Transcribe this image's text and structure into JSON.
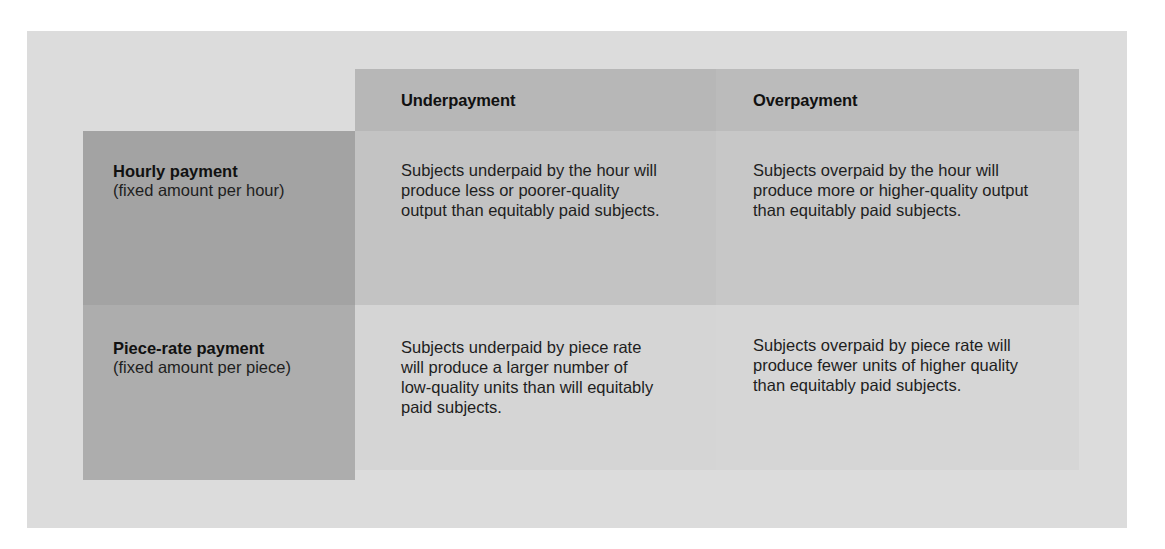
{
  "table": {
    "columns": [
      {
        "label": "Underpayment"
      },
      {
        "label": "Overpayment"
      }
    ],
    "rows": [
      {
        "title": "Hourly payment",
        "subtitle": "(fixed amount per hour)",
        "cells": [
          "Subjects underpaid by the hour will produce less or poorer-quality output than equitably paid subjects.",
          "Subjects overpaid by the hour will produce more or higher-quality output than equitably paid subjects."
        ]
      },
      {
        "title": "Piece-rate payment",
        "subtitle": "(fixed amount per piece)",
        "cells": [
          "Subjects underpaid by piece rate will produce a larger number of low-quality units than will equitably paid subjects.",
          "Subjects overpaid by piece rate will produce fewer units of higher quality than equitably paid subjects."
        ]
      }
    ]
  },
  "colors": {
    "outer_background": "#dcdcdc",
    "column_header": "#b8b8b8",
    "row1_header": "#a3a3a3",
    "row2_header": "#adadad",
    "row1_cells": "#c4c4c4",
    "row2_cells": "#d5d5d5",
    "text": "#1e1e1e"
  }
}
